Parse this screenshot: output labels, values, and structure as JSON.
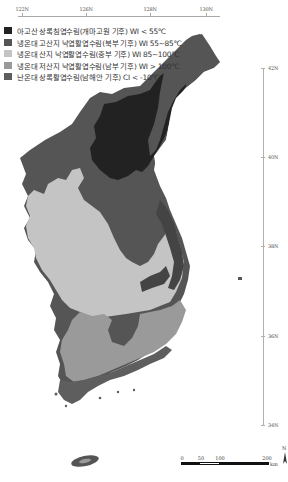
{
  "map": {
    "type": "vegetation-climate zone map of the Korean Peninsula",
    "longitude_labels": [
      {
        "label": "122N",
        "x": 22
      },
      {
        "label": "126N",
        "x": 86
      },
      {
        "label": "128N",
        "x": 150
      },
      {
        "label": "130N",
        "x": 206
      }
    ],
    "latitude_labels": [
      {
        "label": "42N",
        "y": 68
      },
      {
        "label": "40N",
        "y": 157
      },
      {
        "label": "38N",
        "y": 246
      },
      {
        "label": "36N",
        "y": 336
      },
      {
        "label": "34N",
        "y": 425
      }
    ],
    "legend": [
      {
        "label": "아고산 상록침엽수림(개마고원 기후) WI < 55℃",
        "color": "#222222"
      },
      {
        "label": "냉온대 고산지 낙엽활엽수림(북부 기후) WI 55~85℃",
        "color": "#555555"
      },
      {
        "label": "냉온대 산지 낙엽활엽수림(중부 기후) WI 85~100℃",
        "color": "#c4c4c4"
      },
      {
        "label": "냉온대 저산지 낙엽활엽수림(남부 기후) WI > 100℃",
        "color": "#9a9a9a"
      },
      {
        "label": "난온대 상록활엽수림(남해안 기후) CI < -10℃",
        "color": "#5e5e5e"
      }
    ],
    "scale_bar": {
      "ticks": [
        "0",
        "50",
        "100",
        "200"
      ],
      "unit": "km"
    },
    "north_arrow": "N"
  }
}
